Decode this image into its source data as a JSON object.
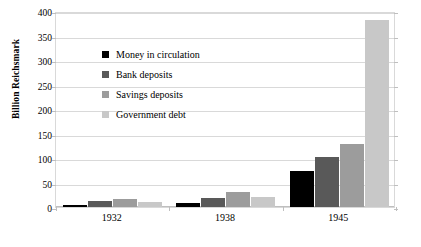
{
  "chart_data": {
    "type": "bar",
    "title": "",
    "xlabel": "",
    "ylabel": "Billion Reichsmark",
    "categories": [
      "1932",
      "1938",
      "1945"
    ],
    "ylim": [
      0,
      400
    ],
    "yticks": [
      0,
      50,
      100,
      150,
      200,
      250,
      300,
      350,
      400
    ],
    "ytick_labels": [
      "0",
      "50",
      "100",
      "150",
      "200",
      "250",
      "300",
      "350",
      "400"
    ],
    "grid": true,
    "legend_position": "upper-left-inside",
    "series": [
      {
        "name": "Money in circulation",
        "color": "#000000",
        "values": [
          5,
          9,
          73
        ]
      },
      {
        "name": "Bank deposits",
        "color": "#595959",
        "values": [
          13,
          18,
          103
        ]
      },
      {
        "name": "Savings deposits",
        "color": "#9c9c9c",
        "values": [
          16,
          30,
          128
        ]
      },
      {
        "name": "Government debt",
        "color": "#c8c8c8",
        "values": [
          11,
          21,
          382
        ]
      }
    ]
  }
}
